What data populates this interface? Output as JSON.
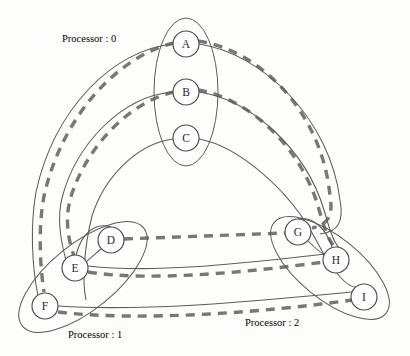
{
  "figure": {
    "type": "graph-partition-diagram",
    "background_color": "#fdfdfc",
    "width": 410,
    "height": 356
  },
  "nodes": [
    {
      "id": "A",
      "label": "A",
      "cx": 186,
      "cy": 44,
      "r": 13,
      "processor": 0
    },
    {
      "id": "B",
      "label": "B",
      "cx": 186,
      "cy": 92,
      "r": 13,
      "processor": 0
    },
    {
      "id": "C",
      "label": "C",
      "cx": 186,
      "cy": 138,
      "r": 13,
      "processor": 0
    },
    {
      "id": "D",
      "label": "D",
      "cx": 111,
      "cy": 240,
      "r": 13,
      "processor": 1
    },
    {
      "id": "E",
      "label": "E",
      "cx": 75,
      "cy": 268,
      "r": 13,
      "processor": 1
    },
    {
      "id": "F",
      "label": "F",
      "cx": 45,
      "cy": 306,
      "r": 13,
      "processor": 1
    },
    {
      "id": "G",
      "label": "G",
      "cx": 298,
      "cy": 232,
      "r": 13,
      "processor": 2
    },
    {
      "id": "H",
      "label": "H",
      "cx": 336,
      "cy": 260,
      "r": 13,
      "processor": 2
    },
    {
      "id": "I",
      "label": "I",
      "cx": 364,
      "cy": 297,
      "r": 13,
      "processor": 2
    }
  ],
  "clusters": [
    {
      "id": "processor-0",
      "label": "Processor : 0",
      "label_x": 62,
      "label_y": 33,
      "members": [
        "A",
        "B",
        "C"
      ],
      "shape": "ellipse",
      "cx": 186,
      "cy": 92,
      "rx": 32,
      "ry": 74,
      "rotate": 0
    },
    {
      "id": "processor-1",
      "label": "Processor : 1",
      "label_x": 68,
      "label_y": 329,
      "members": [
        "D",
        "E",
        "F"
      ],
      "shape": "ellipse",
      "cx": 83,
      "cy": 277,
      "rx": 78,
      "ry": 33,
      "rotate": -39
    },
    {
      "id": "processor-2",
      "label": "Processor : 2",
      "label_x": 245,
      "label_y": 317,
      "members": [
        "G",
        "H",
        "I"
      ],
      "shape": "ellipse",
      "cx": 330,
      "cy": 268,
      "rx": 72,
      "ry": 31,
      "rotate": 39
    }
  ],
  "edges_solid": [
    {
      "id": "A-D",
      "from": "A",
      "to": "D",
      "style": "solid-arc"
    },
    {
      "id": "B-E",
      "from": "B",
      "to": "E",
      "style": "solid-arc"
    },
    {
      "id": "C-F",
      "from": "C",
      "to": "F",
      "style": "solid-arc"
    },
    {
      "id": "A-G",
      "from": "A",
      "to": "G",
      "style": "solid-arc"
    },
    {
      "id": "B-H",
      "from": "B",
      "to": "H",
      "style": "solid-arc"
    },
    {
      "id": "C-I",
      "from": "C",
      "to": "I",
      "style": "solid-arc"
    },
    {
      "id": "E-H",
      "from": "E",
      "to": "H",
      "style": "solid-arc"
    },
    {
      "id": "F-I",
      "from": "F",
      "to": "I",
      "style": "solid-arc"
    },
    {
      "id": "D-E",
      "from": "D",
      "to": "E",
      "style": "solid-short"
    },
    {
      "id": "G-H",
      "from": "G",
      "to": "H",
      "style": "solid-short"
    }
  ],
  "edges_dashed": [
    {
      "id": "A-G-dashed",
      "from": "A",
      "to": "G",
      "style": "dashed-arc"
    },
    {
      "id": "B-H-dashed",
      "from": "B",
      "to": "H",
      "style": "dashed-arc"
    },
    {
      "id": "A-D-dashed",
      "from": "A",
      "to": "D",
      "style": "dashed-arc"
    },
    {
      "id": "B-E-dashed",
      "from": "B",
      "to": "E",
      "style": "dashed-arc"
    },
    {
      "id": "D-G-dashed",
      "from": "D",
      "to": "G",
      "style": "dashed-straight"
    },
    {
      "id": "E-H-dashed",
      "from": "E",
      "to": "H",
      "style": "dashed-arc"
    },
    {
      "id": "F-I-dashed",
      "from": "F",
      "to": "I",
      "style": "dashed-arc"
    }
  ],
  "style": {
    "node_stroke": "#4a4a4a",
    "node_fill": "#fefefe",
    "cluster_stroke": "#5a5a5a",
    "solid_edge_color": "#5c5c5c",
    "dashed_edge_color": "#777777",
    "text_color": "#232323"
  }
}
